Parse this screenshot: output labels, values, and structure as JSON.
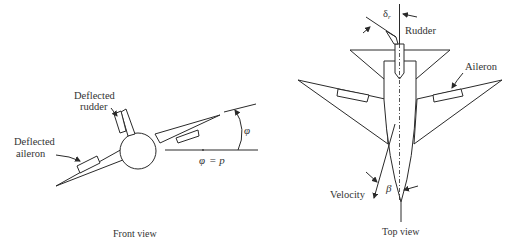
{
  "front_view": {
    "caption": "Front view",
    "labels": {
      "rudder_line1": "Deflected",
      "rudder_line2": "rudder",
      "aileron_line1": "Deflected",
      "aileron_line2": "aileron",
      "roll_angle": "φ",
      "roll_rate_lhs": "φ",
      "roll_rate_eq": "= p"
    }
  },
  "top_view": {
    "caption": "Top view",
    "labels": {
      "rudder_deflection": "δ",
      "rudder_deflection_sub": "r",
      "rudder": "Rudder",
      "aileron": "Aileron",
      "velocity": "Velocity",
      "sideslip": "β"
    }
  },
  "colors": {
    "line": "#2a2a2a",
    "text": "#333333",
    "background": "#ffffff"
  }
}
